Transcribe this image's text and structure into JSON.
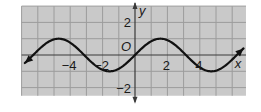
{
  "chart_data": {
    "type": "line",
    "title": "",
    "xlabel": "x",
    "ylabel": "y",
    "origin_label": "O",
    "function": "y = sin(x)",
    "xlim": [
      -7,
      6.85
    ],
    "ylim": [
      -2.5,
      3
    ],
    "grid": true,
    "grid_step": 1,
    "x_ticks": [
      -4,
      -2,
      2,
      4
    ],
    "x_tick_labels": [
      "−4",
      "−2",
      "2",
      "4"
    ],
    "y_ticks": [
      2,
      -2
    ],
    "y_tick_labels": [
      "2",
      "−2"
    ],
    "series": [
      {
        "name": "curve",
        "x": [
          -6.8,
          -6.28,
          -5.5,
          -4.71,
          -3.93,
          -3.14,
          -2.36,
          -1.57,
          -0.79,
          0,
          0.79,
          1.57,
          2.36,
          3.14,
          3.93,
          4.71,
          5.5,
          6.28,
          6.7
        ],
        "y": [
          -0.49,
          0,
          0.71,
          1,
          0.71,
          0,
          -0.71,
          -1,
          -0.71,
          0,
          0.71,
          1,
          0.71,
          0,
          -0.71,
          -1,
          -0.71,
          0,
          0.41
        ],
        "arrows": "both"
      }
    ],
    "colors": {
      "background": "#c9c9c9",
      "grid": "#9c9c9c",
      "axis": "#3a3a3a",
      "curve": "#111111"
    }
  }
}
